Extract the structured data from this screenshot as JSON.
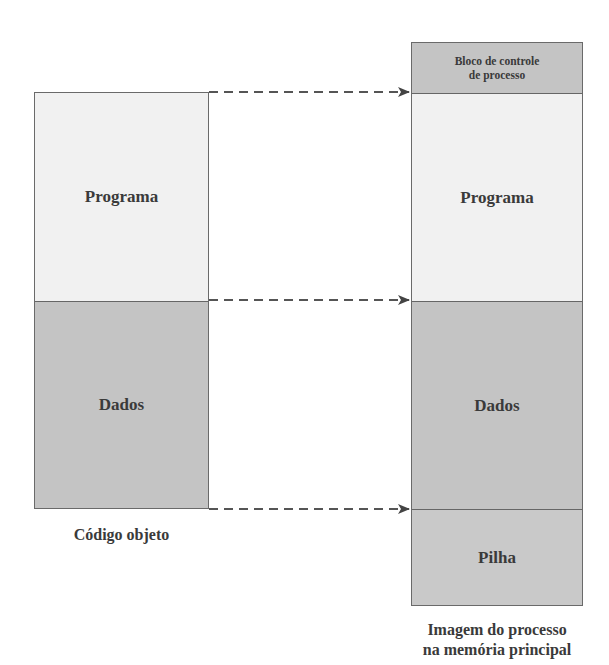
{
  "diagram": {
    "left": {
      "caption": "Código objeto",
      "segments": [
        {
          "label": "Programa",
          "fill": "#f1f1f1"
        },
        {
          "label": "Dados",
          "fill": "#c4c4c4"
        }
      ]
    },
    "right": {
      "caption_line1": "Imagem do processo",
      "caption_line2": "na memória principal",
      "segments": [
        {
          "label_line1": "Bloco de controle",
          "label_line2": "de processo",
          "fill": "#c4c4c4"
        },
        {
          "label": "Programa",
          "fill": "#f1f1f1"
        },
        {
          "label": "Dados",
          "fill": "#c4c4c4"
        },
        {
          "label": "Pilha",
          "fill": "#c9c9c9"
        }
      ]
    },
    "arrows": [
      {
        "from": "Código objeto top (Programa start)",
        "to": "Programa start in process image",
        "style": "dashed"
      },
      {
        "from": "Código objeto Dados start",
        "to": "Dados start in process image",
        "style": "dashed"
      },
      {
        "from": "Código objeto end",
        "to": "Pilha start in process image",
        "style": "dashed"
      }
    ]
  }
}
